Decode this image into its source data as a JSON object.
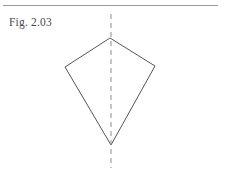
{
  "page": {
    "width": 225,
    "height": 175,
    "background_color": "#ffffff"
  },
  "header_rule": {
    "name": "horizontal-rule",
    "color": "#9a9a9a",
    "x1": 3,
    "y1": 5,
    "x2": 218,
    "y2": 5,
    "stroke_width": 1
  },
  "label": {
    "text": "Fig. 2.03",
    "color": "#4a4a4a",
    "x": 9,
    "y": 16,
    "font_size": 11.5
  },
  "diagram": {
    "title": "Fig. 2.03",
    "type": "geometry-kite-with-axis-of-symmetry",
    "shape": {
      "name": "kite-polygon",
      "stroke_color": "#55555a",
      "stroke_width": 1,
      "fill": "none",
      "points": "110,38 155,66 111,145 65,67",
      "vertices": [
        {
          "label": "apex-top",
          "x": 110,
          "y": 38
        },
        {
          "label": "vertex-right",
          "x": 155,
          "y": 66
        },
        {
          "label": "apex-bottom",
          "x": 111,
          "y": 145
        },
        {
          "label": "vertex-left",
          "x": 65,
          "y": 67
        }
      ]
    },
    "axis": {
      "name": "axis-of-symmetry",
      "stroke_color": "#8d8d92",
      "stroke_width": 1,
      "dash_pattern": "5 4",
      "x1": 111,
      "y1": 14,
      "x2": 111,
      "y2": 168
    }
  }
}
